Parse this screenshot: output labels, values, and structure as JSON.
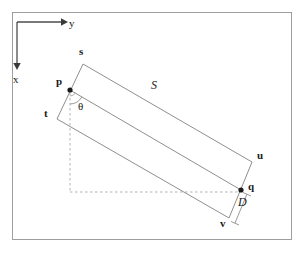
{
  "figure": {
    "frame": {
      "x": 12,
      "y": 12,
      "width": 280,
      "height": 228,
      "stroke": "#9a9a9a"
    },
    "colors": {
      "line": "#8c8c8c",
      "dashed": "#b0b0b0",
      "axis": "#4d4d4d",
      "text": "#1a1a1a",
      "background": "#ffffff"
    },
    "axes": {
      "origin_label": "",
      "x_label": "x",
      "y_label": "y",
      "x_label_pos": {
        "x": 13,
        "y": 80
      },
      "y_label_pos": {
        "x": 68,
        "y": 24
      },
      "origin": {
        "x": 17,
        "y": 22
      },
      "x_arrow_end": {
        "x": 17,
        "y": 69
      },
      "y_arrow_end": {
        "x": 64,
        "y": 22
      }
    },
    "shape": {
      "type": "rotated-rectangle",
      "vertices": {
        "s": {
          "x": 83,
          "y": 64
        },
        "u": {
          "x": 252,
          "y": 162
        },
        "v": {
          "x": 229,
          "y": 218
        },
        "t": {
          "x": 57,
          "y": 119
        }
      },
      "center_line": {
        "p": {
          "x": 70,
          "y": 90
        },
        "q": {
          "x": 241,
          "y": 190
        }
      }
    },
    "points": [
      {
        "name": "p",
        "label": "p",
        "x": 70,
        "y": 90,
        "label_x": 56,
        "label_y": 82,
        "marker": true
      },
      {
        "name": "q",
        "label": "q",
        "x": 241,
        "y": 190,
        "label_x": 249,
        "label_y": 184,
        "marker": true
      },
      {
        "name": "s",
        "label": "s",
        "x": 83,
        "y": 64,
        "label_x": 78,
        "label_y": 50,
        "marker": false
      },
      {
        "name": "t",
        "label": "t",
        "x": 57,
        "y": 119,
        "label_x": 44,
        "label_y": 110,
        "marker": false
      },
      {
        "name": "u",
        "label": "u",
        "x": 252,
        "y": 162,
        "label_x": 257,
        "label_y": 152,
        "marker": false
      },
      {
        "name": "v",
        "label": "v",
        "x": 229,
        "y": 218,
        "label_x": 220,
        "label_y": 219,
        "marker": false
      }
    ],
    "annotations": [
      {
        "name": "length-S",
        "label": "S",
        "x": 152,
        "y": 85,
        "style": "italic"
      },
      {
        "name": "width-D",
        "label": "D",
        "x": 239,
        "y": 200,
        "style": "italic"
      },
      {
        "name": "angle-theta",
        "label": "θ",
        "x": 78,
        "y": 100,
        "style": "plain"
      }
    ],
    "dashed_guides": {
      "vertical": {
        "x": 70,
        "y1": 92,
        "y2": 192
      },
      "horizontal": {
        "y": 192,
        "x1": 70,
        "x2": 240
      }
    },
    "dimension_D": {
      "from": {
        "x": 246,
        "y": 193
      },
      "to": {
        "x": 234,
        "y": 222
      }
    }
  }
}
